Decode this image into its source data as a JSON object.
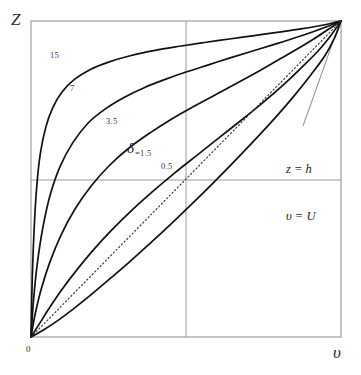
{
  "figure": {
    "background_color": "#ffffff",
    "frame_color": "#8c8c8c",
    "grid_color": "#9a9a9a",
    "curve_color": "#111111",
    "dotted_color": "#3a3a3a",
    "leader_color": "#7a7a7a"
  },
  "axes": {
    "y_label": "Z",
    "x_label": "υ",
    "origin_label": "0"
  },
  "annotation": {
    "line1": "z = h",
    "line2": "υ = U"
  },
  "delta": {
    "symbol": "δ",
    "value": "=1.5"
  },
  "curve_labels": {
    "c15": "15",
    "c7": "7",
    "c35": "3.5",
    "c05": "0.5"
  },
  "chart_data": {
    "type": "line",
    "title": "",
    "xlabel": "υ",
    "ylabel": "Z",
    "xlim": [
      0,
      1
    ],
    "ylim": [
      0,
      1
    ],
    "grid": true,
    "gridlines": {
      "x": [
        0.5
      ],
      "y": [
        0.5
      ]
    },
    "tick_labels": {
      "x": [
        "0"
      ],
      "y": []
    },
    "legend_position": "inline-curve-labels",
    "parameter_name": "δ",
    "annotations": [
      {
        "text": "z = h",
        "at_x": 0.82,
        "at_y": 0.66,
        "points_to_x": 1.0,
        "points_to_y": 1.0
      },
      {
        "text": "υ = U",
        "at_x": 0.82,
        "at_y": 0.62,
        "points_to_x": 1.0,
        "points_to_y": 1.0
      }
    ],
    "series": [
      {
        "name": "δ = 15",
        "label": "15",
        "style": "solid",
        "label_x": 0.06,
        "label_y": 0.91,
        "x": [
          0.0,
          0.004,
          0.01,
          0.018,
          0.03,
          0.048,
          0.07,
          0.1,
          0.14,
          0.19,
          0.25,
          0.32,
          0.4,
          0.48,
          0.56,
          0.64,
          0.72,
          0.8,
          0.87,
          0.93,
          0.97,
          1.0
        ],
        "y": [
          0.0,
          0.185,
          0.34,
          0.47,
          0.58,
          0.665,
          0.725,
          0.775,
          0.815,
          0.846,
          0.87,
          0.89,
          0.907,
          0.92,
          0.932,
          0.943,
          0.954,
          0.965,
          0.975,
          0.985,
          0.993,
          1.0
        ]
      },
      {
        "name": "δ = 7",
        "label": "7",
        "style": "solid",
        "label_x": 0.13,
        "label_y": 0.8,
        "x": [
          0.0,
          0.008,
          0.02,
          0.038,
          0.062,
          0.094,
          0.135,
          0.185,
          0.24,
          0.3,
          0.365,
          0.435,
          0.505,
          0.575,
          0.645,
          0.715,
          0.785,
          0.85,
          0.91,
          0.96,
          1.0
        ],
        "y": [
          0.0,
          0.115,
          0.23,
          0.345,
          0.45,
          0.54,
          0.615,
          0.678,
          0.722,
          0.758,
          0.789,
          0.816,
          0.84,
          0.862,
          0.884,
          0.905,
          0.926,
          0.946,
          0.966,
          0.984,
          1.0
        ]
      },
      {
        "name": "δ = 3.5",
        "label": "3.5",
        "style": "solid",
        "label_x": 0.25,
        "label_y": 0.69,
        "x": [
          0.0,
          0.014,
          0.034,
          0.062,
          0.098,
          0.142,
          0.194,
          0.252,
          0.316,
          0.384,
          0.454,
          0.526,
          0.598,
          0.668,
          0.736,
          0.8,
          0.86,
          0.912,
          0.958,
          1.0
        ],
        "y": [
          0.0,
          0.075,
          0.155,
          0.24,
          0.325,
          0.405,
          0.478,
          0.542,
          0.598,
          0.646,
          0.69,
          0.73,
          0.768,
          0.805,
          0.842,
          0.878,
          0.912,
          0.943,
          0.973,
          1.0
        ]
      },
      {
        "name": "δ = 1.5",
        "label": "δ =1.5",
        "style": "solid",
        "label_x": 0.34,
        "label_y": 0.58,
        "x": [
          0.0,
          0.026,
          0.058,
          0.098,
          0.146,
          0.2,
          0.26,
          0.324,
          0.392,
          0.462,
          0.534,
          0.606,
          0.678,
          0.748,
          0.814,
          0.874,
          0.926,
          0.968,
          1.0
        ],
        "y": [
          0.0,
          0.04,
          0.09,
          0.148,
          0.21,
          0.274,
          0.338,
          0.4,
          0.46,
          0.518,
          0.574,
          0.63,
          0.686,
          0.742,
          0.798,
          0.854,
          0.905,
          0.955,
          1.0
        ]
      },
      {
        "name": "δ = 0.5",
        "label": "0.5",
        "style": "solid",
        "label_x": 0.44,
        "label_y": 0.55,
        "x": [
          0.0,
          0.04,
          0.086,
          0.138,
          0.194,
          0.254,
          0.318,
          0.384,
          0.452,
          0.52,
          0.588,
          0.656,
          0.722,
          0.786,
          0.846,
          0.9,
          0.948,
          0.98,
          1.0
        ],
        "y": [
          0.0,
          0.022,
          0.052,
          0.09,
          0.134,
          0.184,
          0.238,
          0.296,
          0.358,
          0.422,
          0.488,
          0.556,
          0.624,
          0.692,
          0.76,
          0.826,
          0.89,
          0.948,
          1.0
        ]
      },
      {
        "name": "δ → 0",
        "label": "",
        "style": "dotted",
        "x": [
          0.0,
          1.0
        ],
        "y": [
          0.0,
          1.0
        ]
      }
    ]
  }
}
